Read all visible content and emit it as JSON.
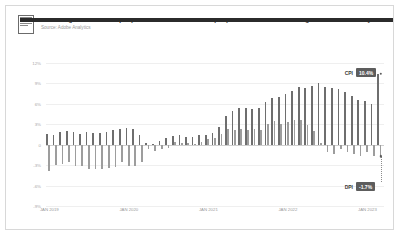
{
  "header": {
    "title": "Adobe Digital Price Index (DPI) vs. Consumer Price Index (CPI): US Year-Over-Year Change in Online Prices by Month",
    "source": "Source: Adobe Analytics",
    "logo_icon": "report-document-icon"
  },
  "colors": {
    "cpi_bar": "#6e6e6e",
    "dpi_bar": "#9d9d9d",
    "badge": "#5d5d5d",
    "grid": "#efefef",
    "zero_line": "#cfcfcf",
    "frame_border": "#d8d8d8",
    "tick_text": "#9a9a9a"
  },
  "callouts": [
    {
      "name": "CPI",
      "value": "10.4%",
      "series": "cpi"
    },
    {
      "name": "DPI",
      "value": "-1.7%",
      "series": "dpi"
    }
  ],
  "chart_data": {
    "type": "bar",
    "title": "Adobe Digital Price Index (DPI) vs. Consumer Price Index (CPI): US Year-Over-Year Change in Online Prices by Month",
    "xlabel": "",
    "ylabel": "",
    "ylim": [
      -9,
      12
    ],
    "yticks": [
      12,
      9,
      6,
      3,
      0,
      -3,
      -6,
      -9
    ],
    "ytick_labels": [
      "12%",
      "9%",
      "6%",
      "3%",
      "0",
      "-3%",
      "-6%",
      "-9%"
    ],
    "grid": true,
    "legend": "annotated-callouts",
    "xtick_labels": [
      "JAN 2019",
      "JAN 2020",
      "JAN 2021",
      "JAN 2022",
      "JAN 2023"
    ],
    "xtick_indices": [
      0,
      12,
      24,
      36,
      48
    ],
    "categories": [
      "JAN 2019",
      "FEB 2019",
      "MAR 2019",
      "APR 2019",
      "MAY 2019",
      "JUN 2019",
      "JUL 2019",
      "AUG 2019",
      "SEP 2019",
      "OCT 2019",
      "NOV 2019",
      "DEC 2019",
      "JAN 2020",
      "FEB 2020",
      "MAR 2020",
      "APR 2020",
      "MAY 2020",
      "JUN 2020",
      "JUL 2020",
      "AUG 2020",
      "SEP 2020",
      "OCT 2020",
      "NOV 2020",
      "DEC 2020",
      "JAN 2021",
      "FEB 2021",
      "MAR 2021",
      "APR 2021",
      "MAY 2021",
      "JUN 2021",
      "JUL 2021",
      "AUG 2021",
      "SEP 2021",
      "OCT 2021",
      "NOV 2021",
      "DEC 2021",
      "JAN 2022",
      "FEB 2022",
      "MAR 2022",
      "APR 2022",
      "MAY 2022",
      "JUN 2022",
      "JUL 2022",
      "AUG 2022",
      "SEP 2022",
      "OCT 2022",
      "NOV 2022",
      "DEC 2022",
      "JAN 2023",
      "FEB 2023",
      "MAR 2023"
    ],
    "series": [
      {
        "name": "CPI",
        "color": "#6e6e6e",
        "values": [
          1.6,
          1.5,
          1.9,
          2.0,
          1.8,
          1.6,
          1.8,
          1.7,
          1.7,
          1.8,
          2.1,
          2.3,
          2.5,
          2.3,
          1.5,
          0.3,
          0.1,
          0.6,
          1.0,
          1.3,
          1.4,
          1.2,
          1.2,
          1.4,
          1.4,
          1.7,
          2.6,
          4.2,
          5.0,
          5.4,
          5.4,
          5.3,
          5.4,
          6.2,
          6.8,
          7.0,
          7.5,
          7.9,
          8.5,
          8.3,
          8.6,
          9.1,
          8.5,
          8.3,
          8.2,
          7.7,
          7.1,
          6.5,
          6.4,
          6.0,
          10.4
        ]
      },
      {
        "name": "DPI",
        "color": "#9d9d9d",
        "values": [
          -3.9,
          -3.0,
          -2.8,
          -2.6,
          -3.1,
          -3.2,
          -3.5,
          -3.6,
          -3.5,
          -3.4,
          -3.3,
          -2.6,
          -3.1,
          -3.2,
          -2.6,
          -0.6,
          -0.9,
          -0.6,
          -0.5,
          0.4,
          0.2,
          0.3,
          0.1,
          0.4,
          0.9,
          1.0,
          1.6,
          2.3,
          2.2,
          2.3,
          2.1,
          2.3,
          2.1,
          3.0,
          3.5,
          3.1,
          3.4,
          3.6,
          3.6,
          2.9,
          2.0,
          0.3,
          -1.0,
          -1.3,
          -0.6,
          -1.0,
          -1.3,
          -1.6,
          -1.0,
          -1.7,
          -1.7
        ]
      }
    ]
  }
}
